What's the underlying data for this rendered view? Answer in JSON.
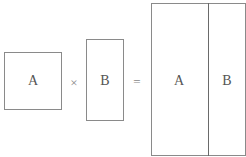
{
  "diagram": {
    "left_matrix": {
      "label": "A"
    },
    "operator_multiply": "×",
    "right_matrix": {
      "label": "B"
    },
    "operator_equals": "=",
    "result": {
      "left_block": {
        "label": "A"
      },
      "right_block": {
        "label": "B"
      }
    }
  }
}
